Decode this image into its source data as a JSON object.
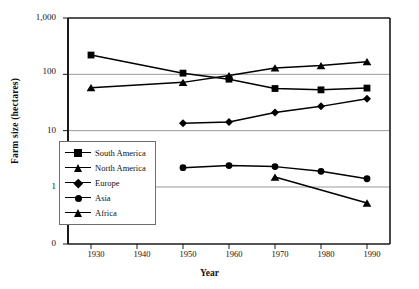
{
  "chart_data": {
    "type": "line",
    "title": "",
    "xlabel": "Year",
    "ylabel": "Farm size (hectares)",
    "x": [
      1930,
      1950,
      1960,
      1970,
      1980,
      1990
    ],
    "xlim": [
      1925,
      1995
    ],
    "ylim": [
      1,
      1000
    ],
    "yscale": "log",
    "grid": true,
    "legend_position": "inside-left",
    "xticks": [
      "1930",
      "1940",
      "1950",
      "1960",
      "1970",
      "1980",
      "1990"
    ],
    "xtick_values": [
      1930,
      1940,
      1950,
      1960,
      1970,
      1980,
      1990
    ],
    "yticks": [
      "1,000",
      "100",
      "10",
      "1",
      "0"
    ],
    "ytick_values": [
      1000,
      100,
      10,
      1,
      0
    ],
    "series": [
      {
        "name": "South America",
        "marker": "square",
        "x": [
          1930,
          1950,
          1960,
          1970,
          1980,
          1990
        ],
        "values": [
          220,
          105,
          82,
          56,
          53,
          57
        ]
      },
      {
        "name": "North America",
        "marker": "triangle",
        "x": [
          1930,
          1950,
          1960,
          1970,
          1980,
          1990
        ],
        "values": [
          58,
          72,
          95,
          130,
          143,
          168
        ]
      },
      {
        "name": "Europe",
        "marker": "diamond",
        "x": [
          1950,
          1960,
          1970,
          1980,
          1990
        ],
        "values": [
          13.5,
          14.2,
          21,
          27,
          37
        ]
      },
      {
        "name": "Asia",
        "marker": "circle",
        "x": [
          1950,
          1960,
          1970,
          1980,
          1990
        ],
        "values": [
          2.2,
          2.4,
          2.3,
          1.9,
          1.4
        ]
      },
      {
        "name": "Africa",
        "marker": "triangle",
        "x": [
          1970,
          1990
        ],
        "values": [
          1.5,
          0.52
        ]
      }
    ]
  },
  "axes": {
    "y_title": "Farm size (hectares)",
    "x_title": "Year"
  },
  "legend": {
    "entries": [
      {
        "label": "South America",
        "marker": "square"
      },
      {
        "label": "North America",
        "marker": "triangle"
      },
      {
        "label": "Europe",
        "marker": "diamond"
      },
      {
        "label": "Asia",
        "marker": "circle"
      },
      {
        "label": "Africa",
        "marker": "triangle"
      }
    ]
  },
  "colors": {
    "line": "#000000",
    "grid": "#9a9a9a",
    "frame": "#1a1a1a",
    "background": "#ffffff"
  }
}
